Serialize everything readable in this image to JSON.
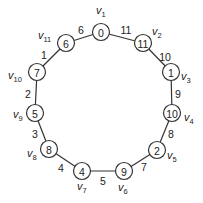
{
  "diagram": {
    "type": "cycle-graph",
    "nodes": [
      {
        "id": "v1",
        "name": "v",
        "sub": "1",
        "value": "0",
        "x": 101,
        "y": 32,
        "lx": 96,
        "ly": 14
      },
      {
        "id": "v2",
        "name": "v",
        "sub": "2",
        "value": "11",
        "x": 143,
        "y": 43,
        "lx": 152,
        "ly": 35
      },
      {
        "id": "v3",
        "name": "v",
        "sub": "3",
        "value": "1",
        "x": 171,
        "y": 72,
        "lx": 181,
        "ly": 80
      },
      {
        "id": "v4",
        "name": "v",
        "sub": "4",
        "value": "10",
        "x": 172,
        "y": 113,
        "lx": 184,
        "ly": 121
      },
      {
        "id": "v5",
        "name": "v",
        "sub": "5",
        "value": "2",
        "x": 157,
        "y": 150,
        "lx": 167,
        "ly": 159
      },
      {
        "id": "v6",
        "name": "v",
        "sub": "6",
        "value": "9",
        "x": 124,
        "y": 171,
        "lx": 118,
        "ly": 191
      },
      {
        "id": "v7",
        "name": "v",
        "sub": "7",
        "value": "4",
        "x": 82,
        "y": 171,
        "lx": 77,
        "ly": 190
      },
      {
        "id": "v8",
        "name": "v",
        "sub": "8",
        "value": "8",
        "x": 49,
        "y": 149,
        "lx": 27,
        "ly": 157
      },
      {
        "id": "v9",
        "name": "v",
        "sub": "9",
        "value": "5",
        "x": 35,
        "y": 113,
        "lx": 13,
        "ly": 118
      },
      {
        "id": "v10",
        "name": "v",
        "sub": "10",
        "value": "7",
        "x": 37,
        "y": 72,
        "lx": 8,
        "ly": 79
      },
      {
        "id": "v11",
        "name": "v",
        "sub": "11",
        "value": "6",
        "x": 66,
        "y": 43,
        "lx": 38,
        "ly": 39
      }
    ],
    "edges": [
      {
        "from": 0,
        "to": 1,
        "label": "11",
        "lx": 126,
        "ly": 30
      },
      {
        "from": 1,
        "to": 2,
        "label": "10",
        "lx": 165,
        "ly": 57
      },
      {
        "from": 2,
        "to": 3,
        "label": "9",
        "lx": 178,
        "ly": 94
      },
      {
        "from": 3,
        "to": 4,
        "label": "8",
        "lx": 171,
        "ly": 134
      },
      {
        "from": 4,
        "to": 5,
        "label": "7",
        "lx": 144,
        "ly": 167
      },
      {
        "from": 5,
        "to": 6,
        "label": "5",
        "lx": 103,
        "ly": 181
      },
      {
        "from": 6,
        "to": 7,
        "label": "4",
        "lx": 61,
        "ly": 168
      },
      {
        "from": 7,
        "to": 8,
        "label": "3",
        "lx": 35,
        "ly": 134
      },
      {
        "from": 8,
        "to": 9,
        "label": "2",
        "lx": 28,
        "ly": 94
      },
      {
        "from": 9,
        "to": 10,
        "label": "1",
        "lx": 44,
        "ly": 55
      },
      {
        "from": 10,
        "to": 0,
        "label": "6",
        "lx": 81,
        "ly": 30
      }
    ]
  }
}
